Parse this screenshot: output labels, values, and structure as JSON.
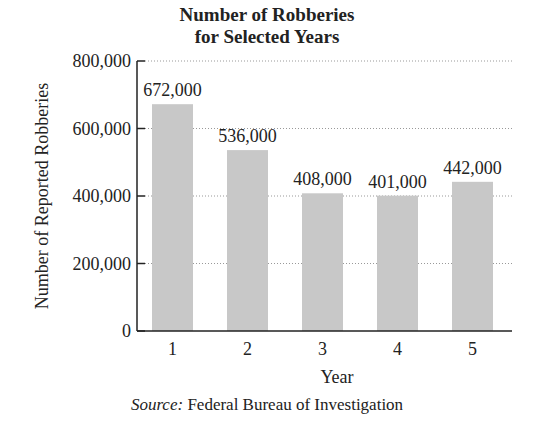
{
  "chart_data": {
    "type": "bar",
    "title": "Number of Robberies for Selected Years",
    "title_lines": [
      "Number of Robberies",
      "for Selected Years"
    ],
    "categories": [
      "1",
      "2",
      "3",
      "4",
      "5"
    ],
    "values": [
      672000,
      536000,
      408000,
      401000,
      442000
    ],
    "data_labels": [
      "672,000",
      "536,000",
      "408,000",
      "401,000",
      "442,000"
    ],
    "xlabel": "Year",
    "ylabel": "Number of Reported Robberies",
    "ylim": [
      0,
      800000
    ],
    "yticks": [
      0,
      200000,
      400000,
      600000,
      800000
    ],
    "ytick_labels": [
      "0",
      "200,000",
      "400,000",
      "600,000",
      "800,000"
    ],
    "grid": "horizontal dotted",
    "legend": null,
    "bar_color": "#c8c8c8",
    "source_label": "Source:",
    "source_text": "Federal Bureau of Investigation"
  }
}
